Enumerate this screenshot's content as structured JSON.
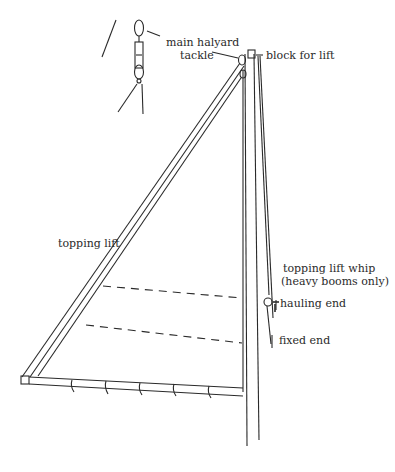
{
  "figure": {
    "line_color": "#2a2a2a",
    "background": "#ffffff"
  },
  "labels": {
    "main_halyard": {
      "line1": "main halyard",
      "line2": "tackle"
    },
    "block_for_lift": "block for lift",
    "topping_lift": "topping lift",
    "topping_lift_whip": {
      "line1": "topping lift whip",
      "line2": "(heavy booms only)"
    },
    "hauling_end": "hauling end",
    "fixed_end": "fixed end"
  }
}
